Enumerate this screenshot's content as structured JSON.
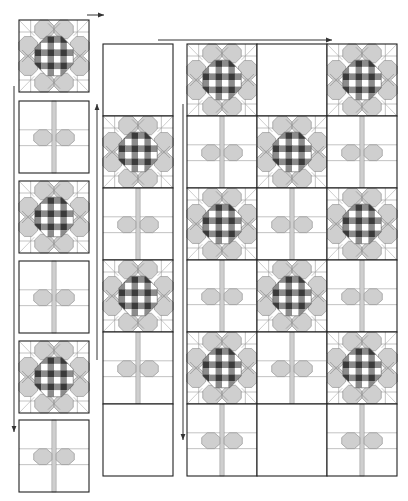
{
  "diagram": {
    "colors": {
      "background": "#ffffff",
      "outline": "#222222",
      "petal": "#cfcfcf",
      "petal_stroke": "#8a8a8a",
      "stem": "#cfcfcf",
      "check_dark": "#3a3a3a",
      "check_mid": "#8c8c8c",
      "check_light": "#ffffff",
      "grid_line": "#9a9a9a",
      "arrow": "#333333"
    },
    "block_size": {
      "w": 70,
      "h": 72
    },
    "left_column": {
      "x": 19,
      "ys": [
        20,
        101,
        181,
        261,
        341,
        420
      ],
      "blocks": [
        "flower",
        "stem",
        "flower",
        "stem",
        "flower",
        "stem"
      ]
    },
    "middle_column": {
      "x": 103,
      "y": 44,
      "blocks": [
        "blank",
        "flower",
        "stem",
        "flower",
        "stem",
        "blank"
      ]
    },
    "right_grid": {
      "x": 187,
      "y": 44,
      "cols": 3,
      "rows": [
        [
          "flower",
          "blank",
          "flower"
        ],
        [
          "stem",
          "flower",
          "stem"
        ],
        [
          "flower",
          "stem",
          "flower"
        ],
        [
          "stem",
          "flower",
          "stem"
        ],
        [
          "flower",
          "stem",
          "flower"
        ],
        [
          "stem",
          "blank",
          "stem"
        ]
      ]
    },
    "arrows": [
      {
        "name": "arrow-top-left",
        "dir": "right",
        "x1": 87,
        "y1": 15,
        "x2": 104,
        "y2": 15
      },
      {
        "name": "arrow-top-right",
        "dir": "right",
        "x1": 158,
        "y1": 40,
        "x2": 332,
        "y2": 40
      },
      {
        "name": "arrow-left-down",
        "dir": "down",
        "x1": 14,
        "y1": 86,
        "x2": 14,
        "y2": 432
      },
      {
        "name": "arrow-middle-up",
        "dir": "up",
        "x1": 97,
        "y1": 360,
        "x2": 97,
        "y2": 104
      },
      {
        "name": "arrow-right-down",
        "dir": "down",
        "x1": 183,
        "y1": 104,
        "x2": 183,
        "y2": 440
      }
    ]
  }
}
